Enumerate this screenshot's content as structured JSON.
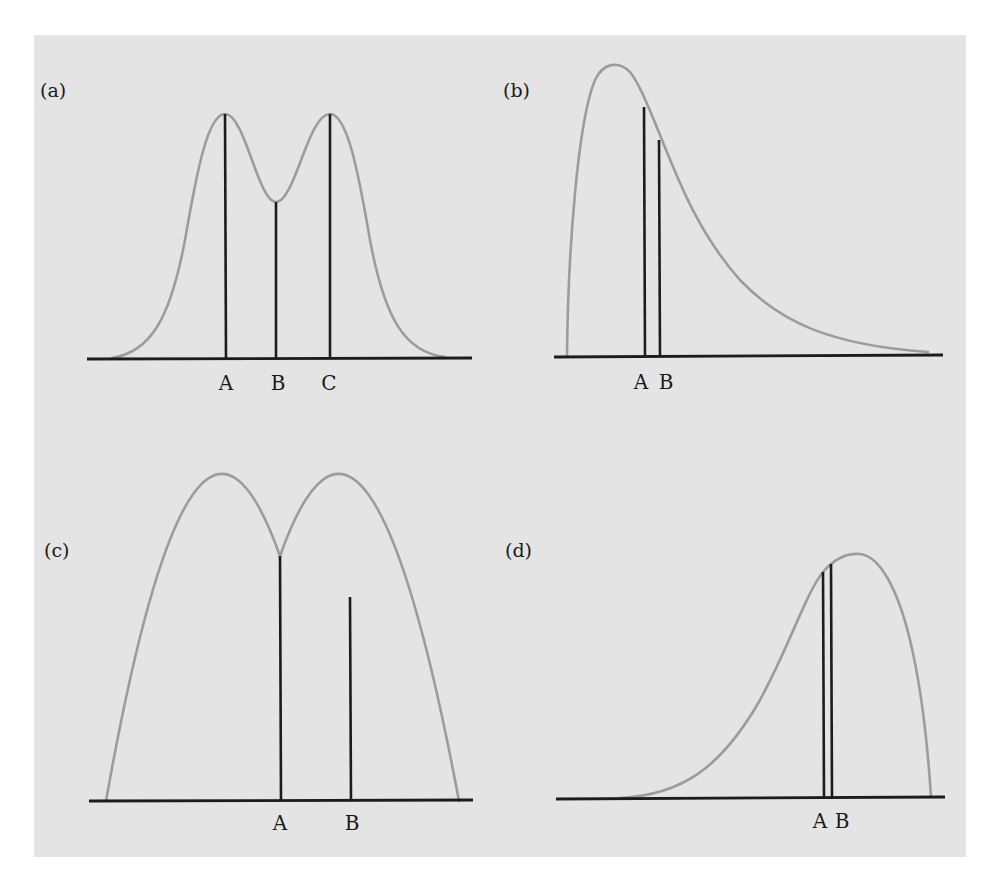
{
  "figure": {
    "background_color": "#e4e4e4",
    "curve_color": "#9c9c9c",
    "line_color": "#1c1c1c",
    "panels": [
      {
        "id": "a",
        "label": "(a)",
        "description": "Bimodal symmetric distribution",
        "markers": [
          {
            "label": "A"
          },
          {
            "label": "B"
          },
          {
            "label": "C"
          }
        ]
      },
      {
        "id": "b",
        "label": "(b)",
        "description": "Right-skewed (positively skewed) distribution",
        "markers": [
          {
            "label": "A"
          },
          {
            "label": "B"
          }
        ]
      },
      {
        "id": "c",
        "label": "(c)",
        "description": "Symmetric unimodal (parabolic) distribution",
        "markers": [
          {
            "label": "A"
          },
          {
            "label": "B"
          }
        ]
      },
      {
        "id": "d",
        "label": "(d)",
        "description": "Left-skewed (negatively skewed) distribution",
        "markers": [
          {
            "label": "A"
          },
          {
            "label": "B"
          }
        ]
      }
    ]
  }
}
